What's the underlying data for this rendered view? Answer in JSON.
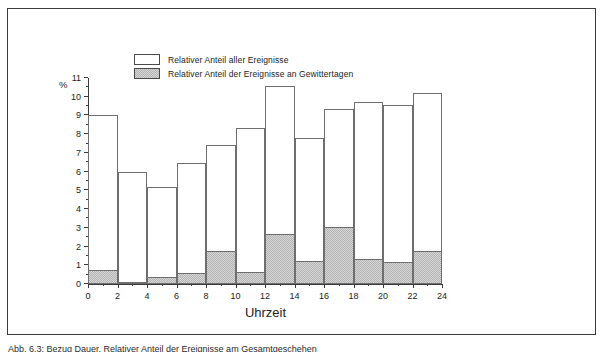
{
  "figure": {
    "caption": "Abb. 6.3:  Bezug Dauer, Relativer Anteil der Ereignisse am Gesamtgeschehen",
    "percent_symbol": "%"
  },
  "legend": {
    "position": "top-left-inside",
    "entries": [
      {
        "label": "Relativer Anteil aller Ereignisse",
        "swatch": "white"
      },
      {
        "label": "Relativer Anteil der Ereignisse an Gewittertagen",
        "swatch": "grey-hatched"
      }
    ]
  },
  "chart_data": {
    "type": "bar",
    "title": "",
    "subtitle": "",
    "xlabel": "Uhrzeit",
    "ylabel": "%",
    "xlim": [
      0,
      24
    ],
    "ylim": [
      0,
      11
    ],
    "grid": false,
    "bar_width_hours": 2,
    "x_ticks": [
      0,
      2,
      4,
      6,
      8,
      10,
      12,
      14,
      16,
      18,
      20,
      22,
      24
    ],
    "x_tick_labels": [
      "0",
      "2",
      "4",
      "6",
      "8",
      "10",
      "12",
      "14",
      "16",
      "18",
      "20",
      "22",
      "24"
    ],
    "x_minor_ticks": [
      1,
      3,
      5,
      7,
      9,
      11,
      13,
      15,
      17,
      19,
      21,
      23
    ],
    "y_ticks": [
      0,
      1,
      2,
      3,
      4,
      5,
      6,
      7,
      8,
      9,
      10,
      11
    ],
    "y_tick_labels": [
      "0",
      "1",
      "2",
      "3",
      "4",
      "5",
      "6",
      "7",
      "8",
      "9",
      "10",
      "11"
    ],
    "y_minor_ticks": [
      0.5,
      1.5,
      2.5,
      3.5,
      4.5,
      5.5,
      6.5,
      7.5,
      8.5,
      9.5,
      10.5
    ],
    "categories": [
      "0-2",
      "2-4",
      "4-6",
      "6-8",
      "8-10",
      "10-12",
      "12-14",
      "14-16",
      "16-18",
      "18-20",
      "20-22",
      "22-24"
    ],
    "bin_starts": [
      0,
      2,
      4,
      6,
      8,
      10,
      12,
      14,
      16,
      18,
      20,
      22
    ],
    "series": [
      {
        "name": "Relativer Anteil aller Ereignisse",
        "style": "white",
        "values": [
          9.0,
          6.0,
          5.2,
          6.45,
          7.4,
          8.35,
          10.6,
          7.8,
          9.35,
          9.7,
          9.55,
          10.2
        ]
      },
      {
        "name": "Relativer Anteil der Ereignisse an Gewittertagen",
        "style": "grey-hatched",
        "values": [
          0.75,
          0.1,
          0.38,
          0.57,
          1.78,
          0.65,
          2.65,
          1.22,
          3.02,
          1.35,
          1.2,
          1.78
        ]
      }
    ]
  },
  "colors": {
    "frame": "#3b3b3b",
    "bar_outline": "#6e6e6e",
    "bar_fill_white": "#ffffff",
    "bar_fill_grey": "#d6d6d6",
    "text": "#1d1d1d",
    "background": "#ffffff"
  }
}
